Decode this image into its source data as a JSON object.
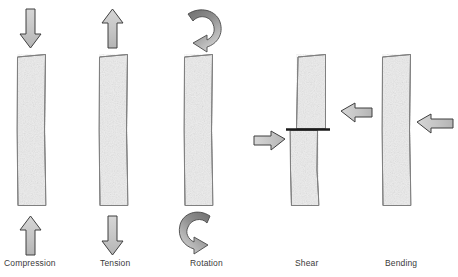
{
  "figure": {
    "title": "",
    "background_color": "#ffffff",
    "width": 458,
    "height": 277
  },
  "colors": {
    "column_fill": "#ededed",
    "column_stroke": "#808080",
    "arrow_fill": "#c8c8c8",
    "arrow_stroke": "#3f3f3f",
    "curved_arrow_fill_dark": "#7f7f7f",
    "curved_arrow_fill_light": "#c0c0c0",
    "curved_arrow_stroke": "#4a4a4a",
    "shear_plane": "#1a1a1a",
    "label_text": "#3a3a3a"
  },
  "panels": [
    {
      "id": "compression",
      "label": "Compression",
      "label_x": 4,
      "label_y": 258,
      "column": {
        "x": 15,
        "y": 55,
        "width": 31,
        "height": 150
      },
      "arrows": [
        {
          "name": "top-arrow-down",
          "direction": "down",
          "x": 30,
          "y": 8,
          "length": 40
        },
        {
          "name": "bottom-arrow-up",
          "direction": "up",
          "x": 30,
          "y": 215,
          "length": 40
        }
      ]
    },
    {
      "id": "tension",
      "label": "Tension",
      "label_x": 100,
      "label_y": 258,
      "column": {
        "x": 97,
        "y": 55,
        "width": 31,
        "height": 150
      },
      "arrows": [
        {
          "name": "top-arrow-up",
          "direction": "up",
          "x": 112,
          "y": 8,
          "length": 40
        },
        {
          "name": "bottom-arrow-down",
          "direction": "down",
          "x": 112,
          "y": 215,
          "length": 40
        }
      ]
    },
    {
      "id": "rotation",
      "label": "Rotation",
      "label_x": 190,
      "label_y": 258,
      "column": {
        "x": 182,
        "y": 55,
        "width": 31,
        "height": 150
      },
      "arrows": [
        {
          "name": "top-curved-arrow",
          "direction": "curved-clockwise",
          "x": 185,
          "y": 8
        },
        {
          "name": "bottom-curved-arrow",
          "direction": "curved-counterclockwise",
          "x": 185,
          "y": 208
        }
      ]
    },
    {
      "id": "shear",
      "label": "Shear",
      "label_x": 295,
      "label_y": 258,
      "column_upper": {
        "x": 296,
        "y": 55,
        "width": 30,
        "height": 73
      },
      "column_lower": {
        "x": 288,
        "y": 131,
        "width": 30,
        "height": 74
      },
      "shear_plane": {
        "x1": 286,
        "y1": 129,
        "x2": 330,
        "y2": 129,
        "thickness": 2.5
      },
      "arrows": [
        {
          "name": "upper-arrow-left",
          "direction": "left",
          "x": 330,
          "y": 105,
          "length": 42
        },
        {
          "name": "lower-arrow-right",
          "direction": "right",
          "x": 243,
          "y": 133,
          "length": 42
        }
      ]
    },
    {
      "id": "bending",
      "label": "Bending",
      "label_x": 385,
      "label_y": 258,
      "column": {
        "x": 380,
        "y": 55,
        "width": 31,
        "height": 150
      },
      "arrows": [
        {
          "name": "side-arrow-left",
          "direction": "left",
          "x": 416,
          "y": 108,
          "length": 42
        }
      ]
    }
  ]
}
